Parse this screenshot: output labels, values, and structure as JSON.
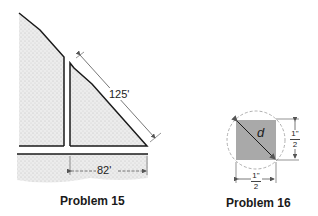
{
  "problem15": {
    "caption": "Problem 15",
    "slant_length_label": "125'",
    "base_length_label": "82'"
  },
  "problem16": {
    "caption": "Problem 16",
    "diagonal_label": "d",
    "side_vertical": {
      "numerator": "1\"",
      "denominator": "2"
    },
    "side_horizontal": {
      "numerator": "1\"",
      "denominator": "2"
    }
  },
  "colors": {
    "stipple": "#e4e4e4",
    "square_fill": "#a9a9a9",
    "line": "#1a1a1a",
    "dim_line": "#555555",
    "circle_dash": "#b0b0b0"
  }
}
